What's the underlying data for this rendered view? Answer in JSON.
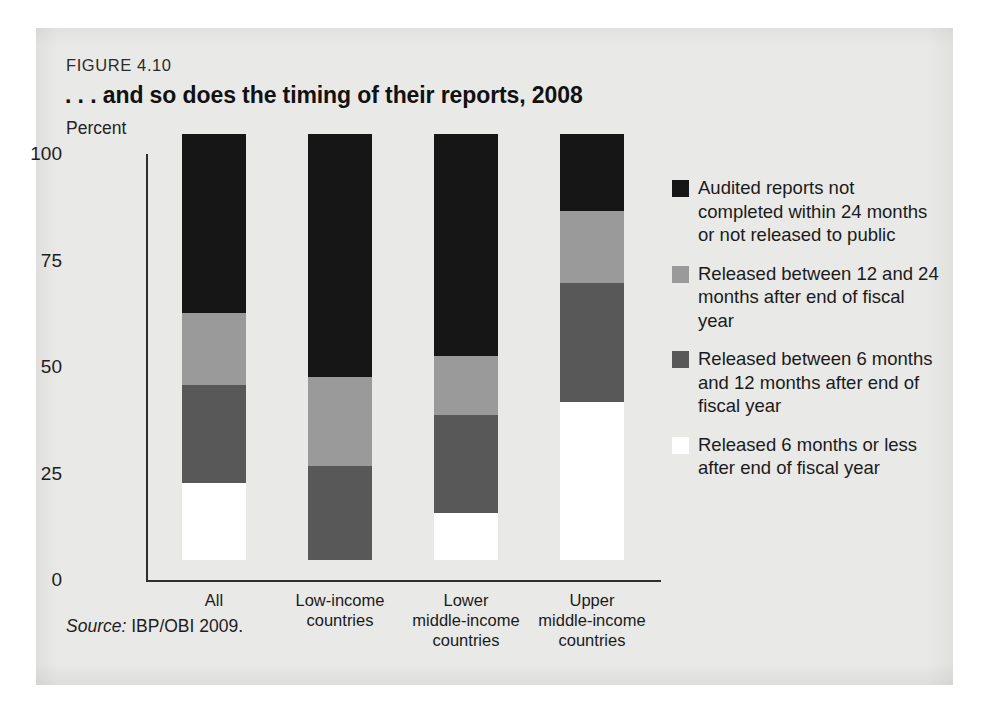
{
  "figure": {
    "number_label": "FIGURE 4.10",
    "title": ". . . and so does the timing of their reports, 2008",
    "unit_label": "Percent",
    "source_label": "Source:",
    "source_text": "IBP/OBI 2009."
  },
  "colors": {
    "panel_background": "#e9e9e7",
    "axis": "#2f2f2f",
    "not_completed": "#161616",
    "between_12_24": "#9a9a9a",
    "between_6_12": "#585858",
    "within_6": "#ffffff"
  },
  "chart_data": {
    "type": "bar",
    "title": ". . . and so does the timing of their reports, 2008",
    "subtitle": "FIGURE 4.10",
    "xlabel": "",
    "ylabel": "Percent",
    "ylim": [
      0,
      100
    ],
    "yticks": [
      0,
      25,
      50,
      75,
      100
    ],
    "ytick_labels": [
      "0",
      "25",
      "50",
      "75",
      "100"
    ],
    "grid": false,
    "stacked": true,
    "legend_position": "right",
    "categories": [
      "All",
      "Low-income countries",
      "Lower middle-income countries",
      "Upper middle-income countries"
    ],
    "category_label_lines": [
      [
        "All"
      ],
      [
        "Low-income",
        "countries"
      ],
      [
        "Lower",
        "middle-income",
        "countries"
      ],
      [
        "Upper",
        "middle-income",
        "countries"
      ]
    ],
    "series": [
      {
        "name": "Released 6 months or less after end of fiscal year",
        "color": "#ffffff",
        "values": [
          18,
          0,
          11,
          37
        ]
      },
      {
        "name": "Released between 6 months and 12 months after end of fiscal year",
        "color": "#585858",
        "values": [
          23,
          22,
          23,
          28
        ]
      },
      {
        "name": "Released between 12 and 24 months after end of fiscal year",
        "color": "#9a9a9a",
        "values": [
          17,
          21,
          14,
          17
        ]
      },
      {
        "name": "Audited reports not completed within 24 months or not released to public",
        "color": "#161616",
        "values": [
          42,
          57,
          52,
          18
        ]
      }
    ]
  },
  "legend": {
    "items": [
      {
        "swatch": "#161616",
        "label": "Audited reports not completed within 24 months or not released to public"
      },
      {
        "swatch": "#9a9a9a",
        "label": "Released between 12 and 24 months after end of fiscal year"
      },
      {
        "swatch": "#585858",
        "label": "Released between 6 months and 12 months after end of fiscal year"
      },
      {
        "swatch": "#ffffff",
        "label": "Released 6 months or less after end of fiscal year"
      }
    ]
  }
}
